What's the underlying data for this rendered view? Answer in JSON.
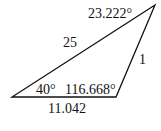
{
  "diagram": {
    "type": "triangle",
    "vertices": {
      "top_right": [
        155,
        5
      ],
      "bottom_left": [
        12,
        97
      ],
      "bottom_right": [
        116,
        97
      ]
    },
    "stroke_color": "#111111",
    "labels": {
      "angle_top": "23.222°",
      "side_long": "25",
      "side_right": "1",
      "angle_bottom_left": "40°",
      "angle_bottom_right": "116.668°",
      "side_bottom": "11.042"
    }
  }
}
